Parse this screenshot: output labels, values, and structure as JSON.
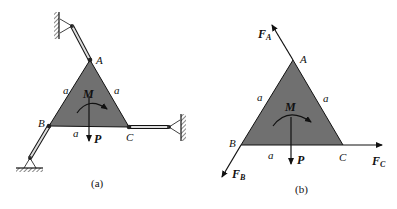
{
  "figure_a": {
    "caption": "(a)",
    "points": {
      "A": "A",
      "B": "B",
      "C": "C"
    },
    "side_labels": [
      "a",
      "a",
      "a"
    ],
    "moment_label": "M",
    "force_label": "P",
    "colors": {
      "triangle_fill": "#707070",
      "stroke": "#111111"
    }
  },
  "figure_b": {
    "caption": "(b)",
    "points": {
      "A": "A",
      "B": "B",
      "C": "C"
    },
    "side_labels": [
      "a",
      "a",
      "a"
    ],
    "moment_label": "M",
    "force_label": "P",
    "reaction_forces": [
      {
        "name": "F",
        "sub": "A"
      },
      {
        "name": "F",
        "sub": "B"
      },
      {
        "name": "F",
        "sub": "C"
      }
    ],
    "colors": {
      "triangle_fill": "#707070",
      "stroke": "#111111"
    }
  }
}
